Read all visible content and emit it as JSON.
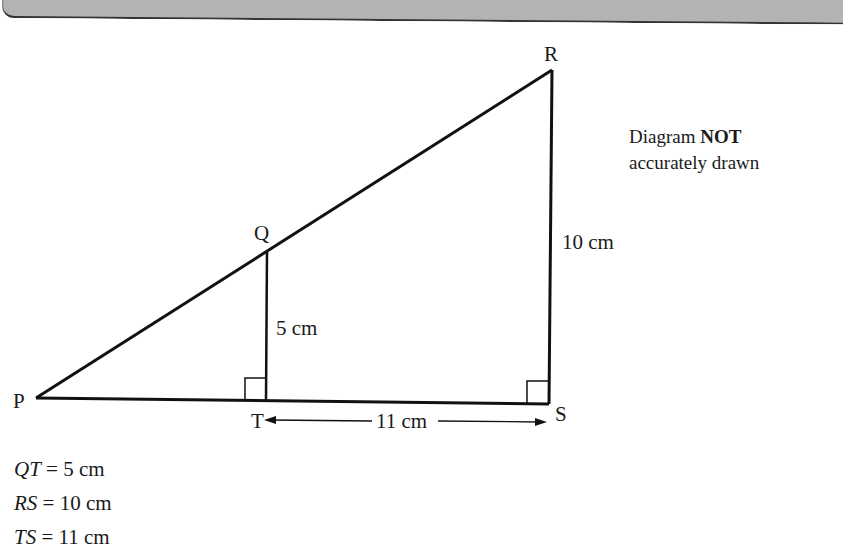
{
  "header": {
    "title": "Exam-style question"
  },
  "diagram": {
    "vertices": {
      "P": "P",
      "Q": "Q",
      "R": "R",
      "S": "S",
      "T": "T"
    },
    "lengths": {
      "QT": "5 cm",
      "RS": "10 cm",
      "TS": "11 cm"
    },
    "right_angles": [
      "T",
      "S"
    ],
    "note": {
      "line1_prefix": "Diagram ",
      "line1_bold": "NOT",
      "line2": "accurately drawn"
    }
  },
  "givens": [
    {
      "lhs": "QT",
      "rhs": "= 5 cm"
    },
    {
      "lhs": "RS",
      "rhs": "= 10 cm"
    },
    {
      "lhs": "TS",
      "rhs": "= 11 cm"
    }
  ]
}
